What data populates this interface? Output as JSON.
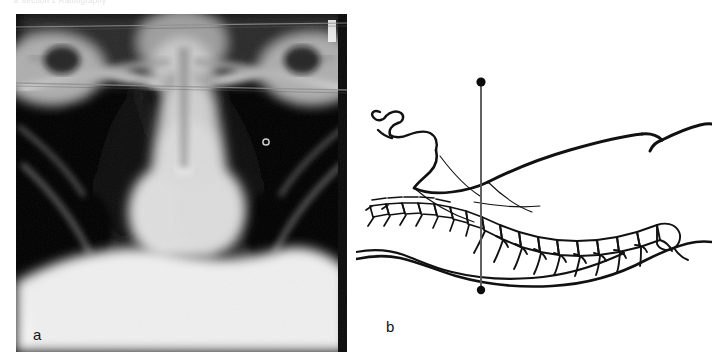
{
  "page": {
    "running_header": "8   Section 1  Radiography",
    "background": "#ffffff"
  },
  "figure": {
    "panels": [
      {
        "id": "a",
        "label": "a",
        "type": "radiograph",
        "modality": "chest-x-ray",
        "view": "anteroposterior",
        "label_color": "#141414",
        "background": "#000000",
        "annotations": {
          "scan_line_count": 2,
          "marker": "ring-marker-right-upper-zone"
        }
      },
      {
        "id": "b",
        "label": "b",
        "type": "line-drawing",
        "subject": "supine-patient-lateral-profile",
        "label_color": "#111111",
        "background": "#ffffff",
        "beam": {
          "orientation": "vertical",
          "top_dot": "beam-source-dot",
          "bottom_dot": "beam-receptor-dot",
          "line_color": "#555555"
        },
        "structures": [
          "face-profile",
          "cervical-vertebrae",
          "thoracic-vertebrae",
          "chest-contour",
          "back-contour",
          "table-surface"
        ]
      }
    ]
  },
  "colors": {
    "ink": "#111111",
    "beam_line": "#5a5a5a",
    "xray_black": "#000000",
    "xray_white": "#f2f2f2",
    "header_grey": "#c9c9cf"
  }
}
